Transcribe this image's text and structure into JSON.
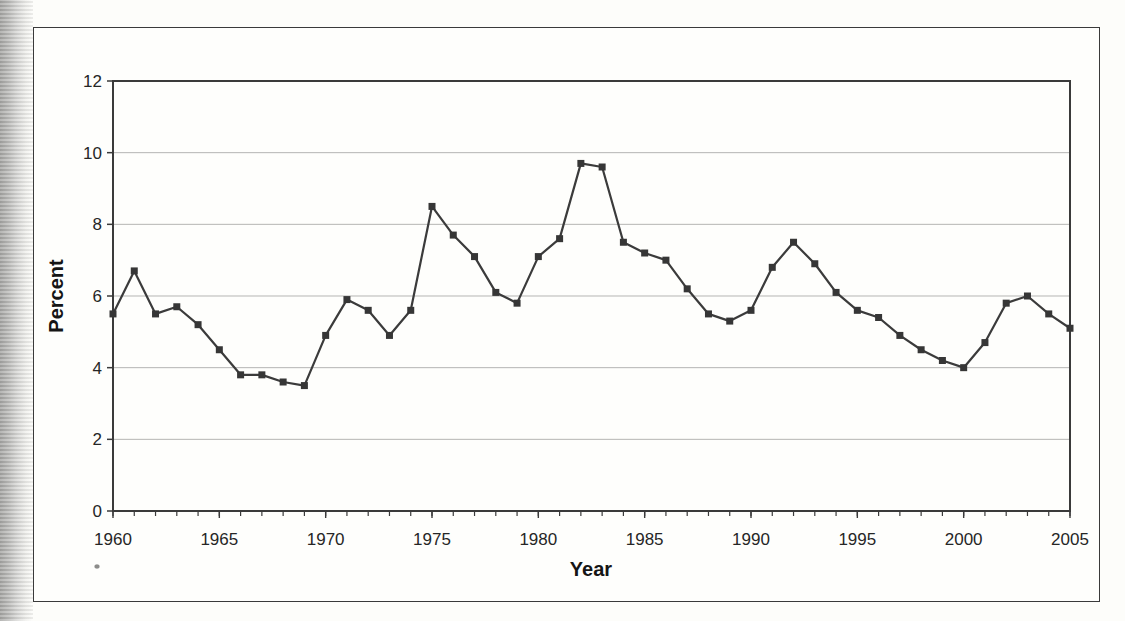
{
  "figure": {
    "xlabel": "Year",
    "ylabel": "Percent"
  },
  "chart_data": {
    "type": "line",
    "title": "",
    "xlabel": "Year",
    "ylabel": "Percent",
    "x": [
      1960,
      1961,
      1962,
      1963,
      1964,
      1965,
      1966,
      1967,
      1968,
      1969,
      1970,
      1971,
      1972,
      1973,
      1974,
      1975,
      1976,
      1977,
      1978,
      1979,
      1980,
      1981,
      1982,
      1983,
      1984,
      1985,
      1986,
      1987,
      1988,
      1989,
      1990,
      1991,
      1992,
      1993,
      1994,
      1995,
      1996,
      1997,
      1998,
      1999,
      2000,
      2001,
      2002,
      2003,
      2004,
      2005
    ],
    "series": [
      {
        "name": "Percent",
        "values": [
          5.5,
          6.7,
          5.5,
          5.7,
          5.2,
          4.5,
          3.8,
          3.8,
          3.6,
          3.5,
          4.9,
          5.9,
          5.6,
          4.9,
          5.6,
          8.5,
          7.7,
          7.1,
          6.1,
          5.8,
          7.1,
          7.6,
          9.7,
          9.6,
          7.5,
          7.2,
          7.0,
          6.2,
          5.5,
          5.3,
          5.6,
          6.8,
          7.5,
          6.9,
          6.1,
          5.6,
          5.4,
          4.9,
          4.5,
          4.2,
          4.0,
          4.7,
          5.8,
          6.0,
          5.5,
          5.1
        ]
      }
    ],
    "xlim": [
      1960,
      2005
    ],
    "ylim": [
      0,
      12
    ],
    "xticks": [
      1960,
      1965,
      1970,
      1975,
      1980,
      1985,
      1990,
      1995,
      2000,
      2005
    ],
    "yticks": [
      0,
      2,
      4,
      6,
      8,
      10,
      12
    ],
    "grid": "horizontal",
    "legend_position": "none",
    "marker": "square",
    "line_color": "#3b3b3b",
    "marker_color": "#363636",
    "grid_color": "#b5b5b3",
    "axis_color": "#3a3a3a",
    "text_color": "#262626"
  }
}
